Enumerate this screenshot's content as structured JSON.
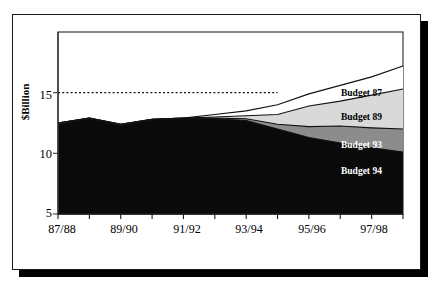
{
  "chart_data": {
    "type": "area",
    "title": "",
    "xlabel": "",
    "ylabel": "$Billion",
    "ylim": [
      5,
      20
    ],
    "yticks": [
      5,
      10,
      15
    ],
    "ytick_labels": [
      "5",
      "10",
      "15"
    ],
    "grid": false,
    "legend_position": "inline-right",
    "stacked": false,
    "x": [
      "87/88",
      "88/89",
      "89/90",
      "90/91",
      "91/92",
      "92/93",
      "93/94",
      "94/95",
      "95/96",
      "96/97",
      "97/98",
      "98/99"
    ],
    "xtick_labels": [
      "87/88",
      "89/90",
      "91/92",
      "93/94",
      "95/96",
      "97/98"
    ],
    "xtick_label_interval": 2,
    "series": [
      {
        "name": "Budget 87",
        "color": "#ffffff",
        "values": [
          12.5,
          12.9,
          12.4,
          12.8,
          12.9,
          13.2,
          13.5,
          14.0,
          14.9,
          15.6,
          16.3,
          17.2
        ]
      },
      {
        "name": "Budget 89",
        "color": "#d9d9d9",
        "values": [
          12.5,
          12.9,
          12.4,
          12.8,
          12.9,
          13.0,
          13.1,
          13.2,
          13.9,
          14.3,
          14.8,
          15.3
        ]
      },
      {
        "name": "Budget 93",
        "color": "#8c8c8c",
        "values": [
          12.5,
          12.9,
          12.4,
          12.8,
          12.9,
          12.9,
          12.85,
          12.4,
          12.2,
          12.25,
          12.1,
          12.0
        ]
      },
      {
        "name": "Budget 94",
        "color": "#0a0a0a",
        "values": [
          12.4,
          12.85,
          12.3,
          12.75,
          12.85,
          12.85,
          12.7,
          12.0,
          11.3,
          10.85,
          10.45,
          10.1
        ]
      }
    ],
    "annotations": [
      {
        "name": "reference-line",
        "type": "hline",
        "value": 15,
        "style": "dotted",
        "x_start": "87/88",
        "x_end": "94/95"
      }
    ]
  },
  "labels": {
    "budget_87": "Budget 87",
    "budget_89": "Budget 89",
    "budget_93": "Budget 93",
    "budget_94": "Budget 94"
  },
  "axis": {
    "y_title": "$Billion",
    "y_tick_5": "5",
    "y_tick_10": "10",
    "y_tick_15": "15",
    "x_tick_0": "87/88",
    "x_tick_1": "89/90",
    "x_tick_2": "91/92",
    "x_tick_3": "93/94",
    "x_tick_4": "95/96",
    "x_tick_5": "97/98"
  },
  "colors": {
    "budget_87_fill": "#ffffff",
    "budget_89_fill": "#d9d9d9",
    "budget_93_fill": "#8c8c8c",
    "budget_94_fill": "#0a0a0a",
    "frame": "#1a1a1a",
    "shadow": "#000000"
  }
}
